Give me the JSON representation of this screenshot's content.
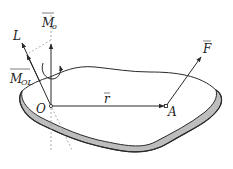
{
  "diagram": {
    "labels": {
      "axis_L": "L",
      "moment_O_main": "M",
      "moment_O_sub": "o",
      "moment_OL_main": "M",
      "moment_OL_sub": "OL",
      "point_O": "O",
      "point_A": "A",
      "position_vector": "r",
      "force": "F"
    },
    "points": {
      "O": [
        51,
        106
      ],
      "A": [
        166,
        106
      ]
    },
    "colors": {
      "line": "#2a2a2a",
      "plate_edge_fill": "#bdbdbd",
      "dashed": "#9a9a9a"
    }
  }
}
